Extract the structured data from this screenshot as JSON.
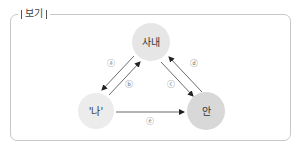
{
  "box": {
    "title": "보기"
  },
  "diagram": {
    "nodes": [
      {
        "id": "sanae",
        "label": "사내",
        "cx": 151,
        "cy": 42,
        "r": 19,
        "fill": "#e6e6e6"
      },
      {
        "id": "na",
        "label": "'나'",
        "cx": 96,
        "cy": 111,
        "r": 18,
        "fill": "#ececec"
      },
      {
        "id": "an",
        "label": "안",
        "cx": 206,
        "cy": 111,
        "r": 19,
        "fill": "#d8d8d8"
      }
    ],
    "edges": [
      {
        "id": "a",
        "label": "ⓐ",
        "from": "sanae",
        "to": "na"
      },
      {
        "id": "b",
        "label": "ⓑ",
        "from": "na",
        "to": "sanae"
      },
      {
        "id": "c",
        "label": "ⓒ",
        "from": "sanae",
        "to": "an"
      },
      {
        "id": "d",
        "label": "ⓓ",
        "from": "an",
        "to": "sanae"
      },
      {
        "id": "e",
        "label": "ⓔ",
        "from": "na",
        "to": "an"
      }
    ]
  }
}
